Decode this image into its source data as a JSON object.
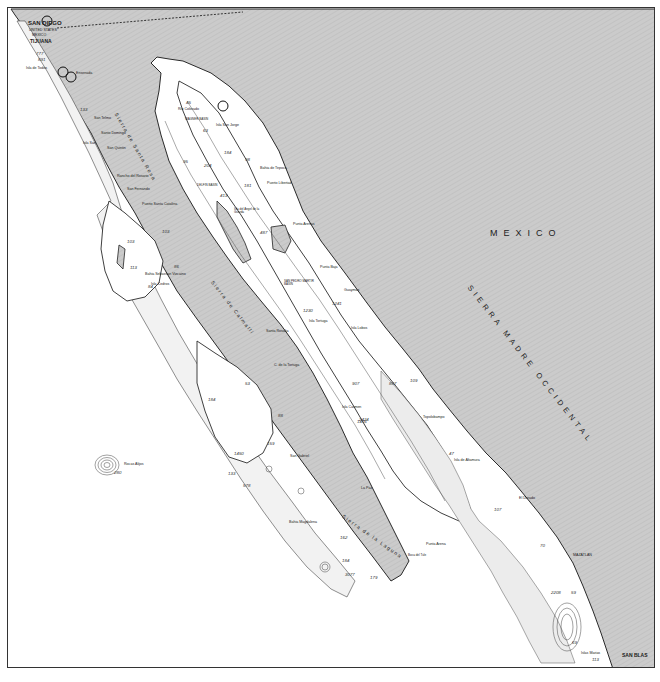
{
  "map": {
    "colors": {
      "land": "#c9c9c9",
      "land_hatch": "#bdbdbd",
      "sea": "#ffffff",
      "shelf": "#ececec",
      "coast": "#2a2a2a",
      "border": "#333333"
    },
    "countries": [
      {
        "id": "mexico",
        "label": "MEXICO"
      }
    ],
    "mountain_ranges": [
      {
        "id": "sierra-madre-occidental",
        "label": "SIERRA MADRE OCCIDENTAL"
      },
      {
        "id": "sierra-de-santa-rosa",
        "label": "Sierra de Santa Rosa"
      },
      {
        "id": "sierra-de-calmalli",
        "label": "Sierra de Calmalli"
      },
      {
        "id": "sierra-de-la-laguna",
        "label": "Sierra de la Laguna"
      }
    ],
    "cities": [
      {
        "id": "san-diego",
        "label": "SAN DIEGO"
      },
      {
        "id": "united-states",
        "label": "UNITED STATES"
      },
      {
        "id": "mexico-border",
        "label": "MEXICO"
      },
      {
        "id": "tijuana",
        "label": "TIJUANA"
      },
      {
        "id": "san-blas",
        "label": "SAN BLAS"
      }
    ],
    "places": [
      {
        "id": "ensenada",
        "label": "Ensenada"
      },
      {
        "id": "isla-de-todos-santos",
        "label": "Isla de Todos"
      },
      {
        "id": "san-telmo",
        "label": "San Telmo"
      },
      {
        "id": "santo-domingo",
        "label": "Santo Domingo"
      },
      {
        "id": "san-quintin",
        "label": "San Quintin"
      },
      {
        "id": "isla-san-martin",
        "label": "Isla San"
      },
      {
        "id": "rosario",
        "label": "Rancho del Rosario"
      },
      {
        "id": "san-fernando",
        "label": "San Fernando"
      },
      {
        "id": "puerto-santa-catalina",
        "label": "Puerto Santa Catalina"
      },
      {
        "id": "bahia-sebastian-vizcaino",
        "label": "Bahia Sebastian Vizcaino"
      },
      {
        "id": "isla-cedros",
        "label": "Isla Cedros"
      },
      {
        "id": "santa-rosalia",
        "label": "Santa Rosalia"
      },
      {
        "id": "bahia-de-tepoca",
        "label": "Bahia de Tepoca"
      },
      {
        "id": "puerto-libertad",
        "label": "Puerto Libertad"
      },
      {
        "id": "delfin-basin",
        "label": "DELFIN BASIN"
      },
      {
        "id": "isla-angel-de-la-guarda",
        "label": "Isla del Angel de la Guarda"
      },
      {
        "id": "punta-arenas",
        "label": "Punta Arenas"
      },
      {
        "id": "punta-baja",
        "label": "Punta Baja"
      },
      {
        "id": "san-pedro-martir-basin",
        "label": "SAN PEDRO MARTIR BASIN"
      },
      {
        "id": "guaymas",
        "label": "Guaymas"
      },
      {
        "id": "isla-tortuga",
        "label": "Isla Tortuga"
      },
      {
        "id": "isla-lobos",
        "label": "Isla Lobos"
      },
      {
        "id": "c-de-la-tortuga",
        "label": "C. de la Tortuga"
      },
      {
        "id": "topolobampo",
        "label": "Topolobampo"
      },
      {
        "id": "isla-del-carmen",
        "label": "Isla Carmen"
      },
      {
        "id": "la-paz",
        "label": "La Paz"
      },
      {
        "id": "isla-de-altamura",
        "label": "Isla de Altamura"
      },
      {
        "id": "el-dorado",
        "label": "El Dorado"
      },
      {
        "id": "mazatlan",
        "label": "MAZATLAN"
      },
      {
        "id": "san-gabriel",
        "label": "San Gabriel"
      },
      {
        "id": "bahia-magdalena",
        "label": "Bahia Magdalena"
      },
      {
        "id": "punta-arena",
        "label": "Punta Arena"
      },
      {
        "id": "boca-del-tule",
        "label": "Boca del Tule"
      },
      {
        "id": "wagner-basin",
        "label": "WAGNER BASIN"
      },
      {
        "id": "isla-san-jorge",
        "label": "Isla San Jorge"
      },
      {
        "id": "roca-alijos",
        "label": "Rocas Alijos"
      },
      {
        "id": "islas-marias",
        "label": "Islas Marias"
      },
      {
        "id": "mouth-of-colorado",
        "label": "Rio Colorado"
      }
    ],
    "depth_soundings": [
      {
        "id": "d1",
        "label": "777"
      },
      {
        "id": "d2",
        "label": "891"
      },
      {
        "id": "d3",
        "label": "133"
      },
      {
        "id": "d4",
        "label": "45"
      },
      {
        "id": "d5",
        "label": "63"
      },
      {
        "id": "d6",
        "label": "184"
      },
      {
        "id": "d7",
        "label": "204"
      },
      {
        "id": "d8",
        "label": "95"
      },
      {
        "id": "d9",
        "label": "98"
      },
      {
        "id": "d10",
        "label": "181"
      },
      {
        "id": "d11",
        "label": "413"
      },
      {
        "id": "d12",
        "label": "487"
      },
      {
        "id": "d13",
        "label": "103"
      },
      {
        "id": "d14",
        "label": "113"
      },
      {
        "id": "d15",
        "label": "86"
      },
      {
        "id": "d16",
        "label": "84"
      },
      {
        "id": "d17",
        "label": "103"
      },
      {
        "id": "d18",
        "label": "1230"
      },
      {
        "id": "d19",
        "label": "1241"
      },
      {
        "id": "d20",
        "label": "907"
      },
      {
        "id": "d21",
        "label": "1416"
      },
      {
        "id": "d22",
        "label": "887"
      },
      {
        "id": "d23",
        "label": "109"
      },
      {
        "id": "d24",
        "label": "53"
      },
      {
        "id": "d25",
        "label": "88"
      },
      {
        "id": "d26",
        "label": "159"
      },
      {
        "id": "d27",
        "label": "184"
      },
      {
        "id": "d28",
        "label": "1450"
      },
      {
        "id": "d29",
        "label": "133"
      },
      {
        "id": "d30",
        "label": "578"
      },
      {
        "id": "d31",
        "label": "2424"
      },
      {
        "id": "d32",
        "label": "162"
      },
      {
        "id": "d33",
        "label": "184"
      },
      {
        "id": "d34",
        "label": "3077"
      },
      {
        "id": "d35",
        "label": "179"
      },
      {
        "id": "d36",
        "label": "47"
      },
      {
        "id": "d37",
        "label": "107"
      },
      {
        "id": "d38",
        "label": "70"
      },
      {
        "id": "d39",
        "label": "2208"
      },
      {
        "id": "d40",
        "label": "59"
      },
      {
        "id": "d41",
        "label": "69"
      },
      {
        "id": "d42",
        "label": "113"
      },
      {
        "id": "d43",
        "label": "2808"
      },
      {
        "id": "d44",
        "label": "95"
      },
      {
        "id": "d45",
        "label": "280"
      }
    ]
  }
}
